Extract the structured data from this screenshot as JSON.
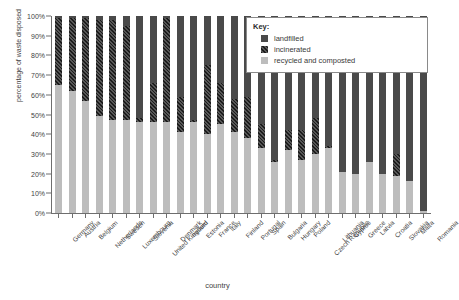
{
  "chart_data": {
    "type": "bar",
    "subtype": "stacked-percentage",
    "title": "",
    "xlabel": "country",
    "ylabel": "percentage of waste disposed",
    "ylim": [
      0,
      100
    ],
    "ytick_labels": [
      "0%",
      "10%",
      "20%",
      "30%",
      "40%",
      "50%",
      "60%",
      "70%",
      "80%",
      "90%",
      "100%"
    ],
    "ytick_values": [
      0,
      10,
      20,
      30,
      40,
      50,
      60,
      70,
      80,
      90,
      100
    ],
    "grid": false,
    "legend_position": "top-right",
    "categories": [
      "Germany",
      "Austria",
      "Belgium",
      "Netherlands",
      "Sweden",
      "Luxembourg",
      "Slovenia",
      "United Kingdom",
      "Denmark",
      "Ireland",
      "Estonia",
      "France",
      "Italy",
      "Finland",
      "Portugal",
      "Spain",
      "Bulgaria",
      "Hungary",
      "Poland",
      "Czech Republic",
      "Lithuania",
      "Cyprus",
      "Greece",
      "Latvia",
      "Croatia",
      "Slovakia",
      "Malta",
      "Romania"
    ],
    "series": [
      {
        "name": "recycled and composted",
        "color": "#bdbdbd",
        "values": [
          65,
          62,
          57,
          49,
          47,
          47,
          46,
          46,
          46,
          41,
          46,
          40,
          45,
          41,
          38,
          33,
          26,
          32,
          27,
          30,
          33,
          21,
          20,
          26,
          20,
          19,
          16,
          1
        ]
      },
      {
        "name": "incinerated",
        "color": "#2e2e2e",
        "hatch": "diagonal",
        "values": [
          34,
          37,
          42,
          49,
          51,
          48,
          2,
          20,
          53,
          18,
          1,
          35,
          21,
          17,
          21,
          12,
          1,
          10,
          15,
          18,
          1,
          0,
          0,
          0,
          0,
          11,
          0,
          0
        ]
      },
      {
        "name": "landfilled",
        "color": "#4a4a4a",
        "values": [
          1,
          1,
          1,
          2,
          2,
          5,
          52,
          34,
          1,
          41,
          53,
          25,
          34,
          42,
          41,
          55,
          73,
          58,
          58,
          52,
          66,
          79,
          80,
          74,
          80,
          70,
          84,
          99
        ]
      }
    ]
  },
  "legend": {
    "title": "Key:",
    "items": [
      {
        "label": "landfilled",
        "swatch": "solid-dark"
      },
      {
        "label": "incinerated",
        "swatch": "hatched"
      },
      {
        "label": "recycled and composted",
        "swatch": "solid-light"
      }
    ]
  },
  "colors": {
    "landfilled": "#4a4a4a",
    "incinerated": "#2e2e2e",
    "recycled": "#bdbdbd",
    "axis": "#6e6e6e",
    "text": "#3a3a3a",
    "background": "#ffffff"
  }
}
